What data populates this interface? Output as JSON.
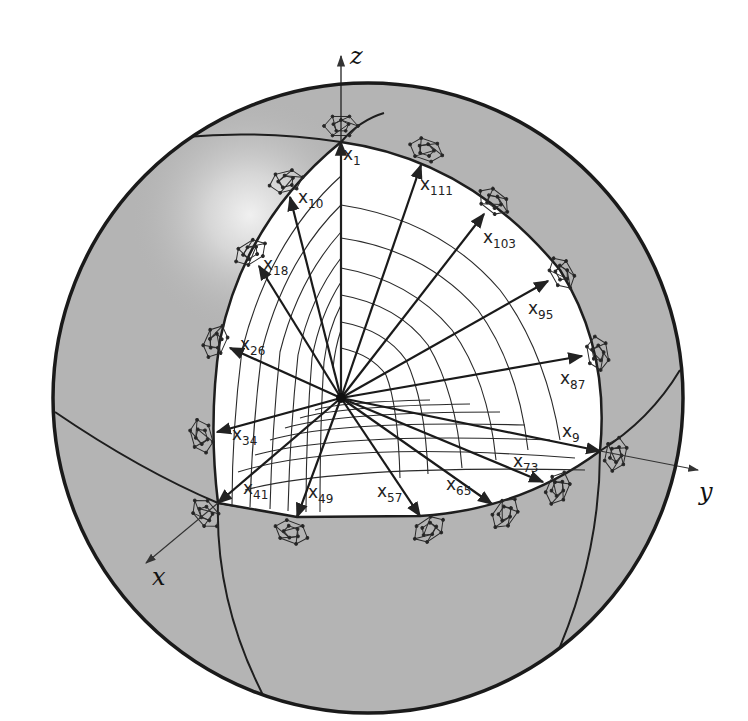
{
  "figure": {
    "axes": [
      {
        "name": "z",
        "label": "z"
      },
      {
        "name": "y",
        "label": "y"
      },
      {
        "name": "x",
        "label": "x"
      }
    ],
    "colors": {
      "sphere_fill": "#b4b4b4",
      "sphere_outline": "#1a1a1a",
      "octant_fill": "#ffffff",
      "line": "#222222",
      "highlight": "#e8e8e8"
    },
    "points": [
      {
        "id": "x1",
        "base": "x",
        "sub": "1",
        "tip": [
          341,
          142
        ],
        "lbl": [
          343,
          160
        ]
      },
      {
        "id": "x111",
        "base": "x",
        "sub": "111",
        "tip": [
          421,
          165
        ],
        "lbl": [
          420,
          190
        ]
      },
      {
        "id": "x103",
        "base": "x",
        "sub": "103",
        "tip": [
          484,
          214
        ],
        "lbl": [
          483,
          243
        ]
      },
      {
        "id": "x95",
        "base": "x",
        "sub": "95",
        "tip": [
          548,
          281
        ],
        "lbl": [
          528,
          314
        ]
      },
      {
        "id": "x87",
        "base": "x",
        "sub": "87",
        "tip": [
          582,
          356
        ],
        "lbl": [
          560,
          384
        ]
      },
      {
        "id": "x9",
        "base": "x",
        "sub": "9",
        "tip": [
          600,
          451
        ],
        "lbl": [
          562,
          437
        ]
      },
      {
        "id": "x73",
        "base": "x",
        "sub": "73",
        "tip": [
          543,
          482
        ],
        "lbl": [
          513,
          467
        ]
      },
      {
        "id": "x65",
        "base": "x",
        "sub": "65",
        "tip": [
          492,
          504
        ],
        "lbl": [
          446,
          490
        ]
      },
      {
        "id": "x57",
        "base": "x",
        "sub": "57",
        "tip": [
          420,
          516
        ],
        "lbl": [
          377,
          497
        ]
      },
      {
        "id": "x49",
        "base": "x",
        "sub": "49",
        "tip": [
          297,
          517
        ],
        "lbl": [
          308,
          498
        ]
      },
      {
        "id": "x41",
        "base": "x",
        "sub": "41",
        "tip": [
          218,
          503
        ],
        "lbl": [
          243,
          494
        ]
      },
      {
        "id": "x34",
        "base": "x",
        "sub": "34",
        "tip": [
          217,
          432
        ],
        "lbl": [
          232,
          440
        ]
      },
      {
        "id": "x26",
        "base": "x",
        "sub": "26",
        "tip": [
          230,
          348
        ],
        "lbl": [
          240,
          350
        ]
      },
      {
        "id": "x18",
        "base": "x",
        "sub": "18",
        "tip": [
          259,
          266
        ],
        "lbl": [
          263,
          270
        ]
      },
      {
        "id": "x10",
        "base": "x",
        "sub": "10",
        "tip": [
          290,
          197
        ],
        "lbl": [
          298,
          203
        ]
      }
    ]
  }
}
